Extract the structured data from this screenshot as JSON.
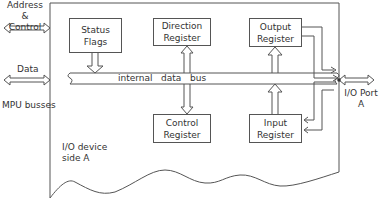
{
  "diagram": {
    "left_labels": {
      "address_control": [
        "Address",
        "&",
        "Control"
      ],
      "data": "Data",
      "mpu_busses": "MPU busses"
    },
    "blocks": [
      {
        "id": "status-flags",
        "lines": [
          "Status",
          "Flags"
        ]
      },
      {
        "id": "direction-register",
        "lines": [
          "Direction",
          "Register"
        ]
      },
      {
        "id": "output-register",
        "lines": [
          "Output",
          "Register"
        ]
      },
      {
        "id": "control-register",
        "lines": [
          "Control",
          "Register"
        ]
      },
      {
        "id": "input-register",
        "lines": [
          "Input",
          "Register"
        ]
      }
    ],
    "bus_label": "internal   data   bus",
    "device_label": [
      "I/O device",
      "side A"
    ],
    "port_label": [
      "I/O Port",
      "A"
    ],
    "colors": {
      "line": "#555555",
      "background": "#ffffff"
    }
  }
}
